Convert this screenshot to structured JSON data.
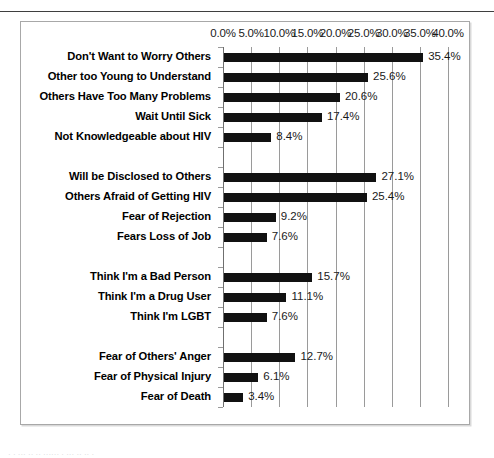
{
  "chart_data": {
    "type": "bar",
    "orientation": "horizontal",
    "title": "",
    "xlabel": "",
    "ylabel": "",
    "xlim": [
      0,
      40
    ],
    "xtick_labels": [
      "0.0%",
      "5.0%",
      "10.0%",
      "15.0%",
      "20.0%",
      "25.0%",
      "30.0%",
      "35.0%",
      "40.0%"
    ],
    "xtick_values": [
      0,
      5,
      10,
      15,
      20,
      25,
      30,
      35,
      40
    ],
    "grid": true,
    "legend": false,
    "bar_color": "#111111",
    "gridline_color": "#9a9a9a",
    "value_label_suffix": "%",
    "groups": [
      {
        "categories": [
          "Don't Want to Worry Others",
          "Other too Young to Understand",
          "Others Have Too Many Problems",
          "Wait Until Sick",
          "Not Knowledgeable about HIV"
        ],
        "values": [
          35.4,
          25.6,
          20.6,
          17.4,
          8.4
        ],
        "value_labels": [
          "35.4%",
          "25.6%",
          "20.6%",
          "17.4%",
          "8.4%"
        ]
      },
      {
        "categories": [
          "Will be Disclosed to Others",
          "Others Afraid of Getting HIV",
          "Fear of Rejection",
          "Fears Loss of Job"
        ],
        "values": [
          27.1,
          25.4,
          9.2,
          7.6
        ],
        "value_labels": [
          "27.1%",
          "25.4%",
          "9.2%",
          "7.6%"
        ]
      },
      {
        "categories": [
          "Think I'm a Bad Person",
          "Think I'm a Drug User",
          "Think I'm LGBT"
        ],
        "values": [
          15.7,
          11.1,
          7.6
        ],
        "value_labels": [
          "15.7%",
          "11.1%",
          "7.6%"
        ]
      },
      {
        "categories": [
          "Fear of Others' Anger",
          "Fear of Physical Injury",
          "Fear of Death"
        ],
        "values": [
          12.7,
          6.1,
          3.4
        ],
        "value_labels": [
          "12.7%",
          "6.1%",
          "3.4%"
        ]
      }
    ],
    "categories": [
      "Don't Want to Worry Others",
      "Other too Young to Understand",
      "Others Have Too Many Problems",
      "Wait Until Sick",
      "Not Knowledgeable about HIV",
      "Will be Disclosed to Others",
      "Others Afraid of Getting HIV",
      "Fear of Rejection",
      "Fears Loss of Job",
      "Think I'm a Bad Person",
      "Think I'm a Drug User",
      "Think I'm LGBT",
      "Fear of Others' Anger",
      "Fear of Physical Injury",
      "Fear of Death"
    ],
    "values": [
      35.4,
      25.6,
      20.6,
      17.4,
      8.4,
      27.1,
      25.4,
      9.2,
      7.6,
      15.7,
      11.1,
      7.6,
      12.7,
      6.1,
      3.4
    ]
  },
  "caption_fragment": "· ·  ···  ·· ··  ······  ·  ··· ·· ··   ·"
}
